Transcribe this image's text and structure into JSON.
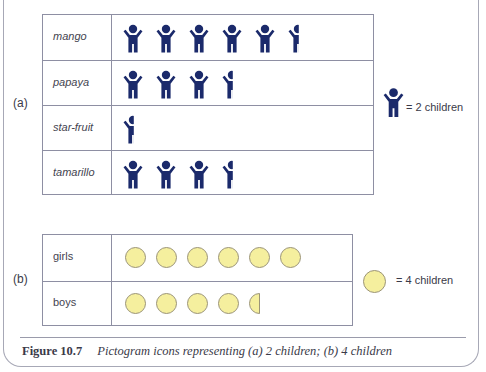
{
  "figure": {
    "number_label": "Figure 10.7",
    "caption": "Pictogram icons representing (a) 2 children; (b) 4 children"
  },
  "part_a": {
    "label": "(a)",
    "icon": "child-figure-icon",
    "icon_color": "#1b2a6b",
    "key_text": "= 2 children",
    "rows": [
      {
        "label": "mango",
        "icons": 5.5
      },
      {
        "label": "papaya",
        "icons": 3.5
      },
      {
        "label": "star-fruit",
        "icons": 0.5
      },
      {
        "label": "tamarillo",
        "icons": 3.5
      }
    ]
  },
  "part_b": {
    "label": "(b)",
    "icon": "circle-icon",
    "icon_color": "#f5ef9e",
    "key_text": "= 4 children",
    "rows": [
      {
        "label": "girls",
        "icons": 6
      },
      {
        "label": "boys",
        "icons": 4.5
      }
    ]
  },
  "chart_data": [
    {
      "type": "pictogram",
      "title": "(a)",
      "unit": "1 icon = 2 children",
      "categories": [
        "mango",
        "papaya",
        "star-fruit",
        "tamarillo"
      ],
      "icons": [
        5.5,
        3.5,
        0.5,
        3.5
      ],
      "values": [
        11,
        7,
        1,
        7
      ]
    },
    {
      "type": "pictogram",
      "title": "(b)",
      "unit": "1 icon = 4 children",
      "categories": [
        "girls",
        "boys"
      ],
      "icons": [
        6,
        4.5
      ],
      "values": [
        24,
        18
      ]
    }
  ]
}
